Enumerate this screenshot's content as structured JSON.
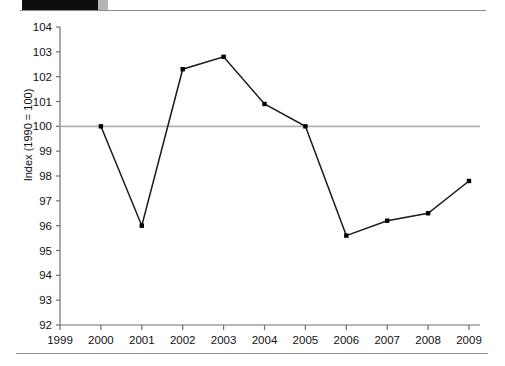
{
  "header": {
    "band_label": "",
    "has_dark_band": true
  },
  "chart_data": {
    "type": "line",
    "title": "",
    "xlabel": "",
    "ylabel": "Index (1990 = 100)",
    "categories": [
      "1999",
      "2000",
      "2001",
      "2002",
      "2003",
      "2004",
      "2005",
      "2006",
      "2007",
      "2008",
      "2009"
    ],
    "x_tick_labels": [
      "1999",
      "2000",
      "2001",
      "2002",
      "2003",
      "2004",
      "2005",
      "2006",
      "2007",
      "2008",
      "2009"
    ],
    "y_tick_labels": [
      "104",
      "103",
      "102",
      "101",
      "100",
      "99",
      "98",
      "97",
      "96",
      "95",
      "94",
      "93",
      "92"
    ],
    "ylim": [
      92,
      104
    ],
    "y_step": 1,
    "xlim": [
      "1999",
      "2009"
    ],
    "grid": false,
    "legend": "none",
    "marker": "square",
    "line_color": "#1a1a1a",
    "marker_color": "#000000",
    "reference_line": {
      "value": 100,
      "color": "#b0b0b0",
      "label": ""
    },
    "series": [
      {
        "name": "Index",
        "x": [
          "1999",
          "2000",
          "2001",
          "2002",
          "2003",
          "2004",
          "2005",
          "2006",
          "2007",
          "2008",
          "2009"
        ],
        "values": [
          null,
          100.0,
          96.0,
          102.3,
          102.8,
          100.9,
          100.0,
          95.6,
          96.2,
          96.5,
          97.8
        ]
      }
    ]
  }
}
